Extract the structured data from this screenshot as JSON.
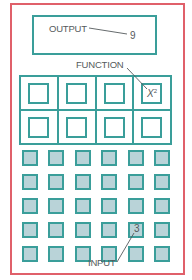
{
  "diagram": {
    "type": "calculator-function-machine",
    "output": {
      "label": "OUTPUT",
      "value": "9"
    },
    "function": {
      "label": "FUNCTION",
      "key_text": "X",
      "key_superscript": "2",
      "rows": 2,
      "cols": 4,
      "highlighted": {
        "row": 0,
        "col": 3
      }
    },
    "input": {
      "label": "INPUT",
      "value": "3",
      "rows": 5,
      "cols": 6,
      "highlighted": {
        "row": 3,
        "col": 4
      }
    }
  },
  "colors": {
    "frame": "#e0606a",
    "outline": "#3a9e9a",
    "input_key_fill": "#b9d3d8",
    "text": "#555a5c"
  }
}
